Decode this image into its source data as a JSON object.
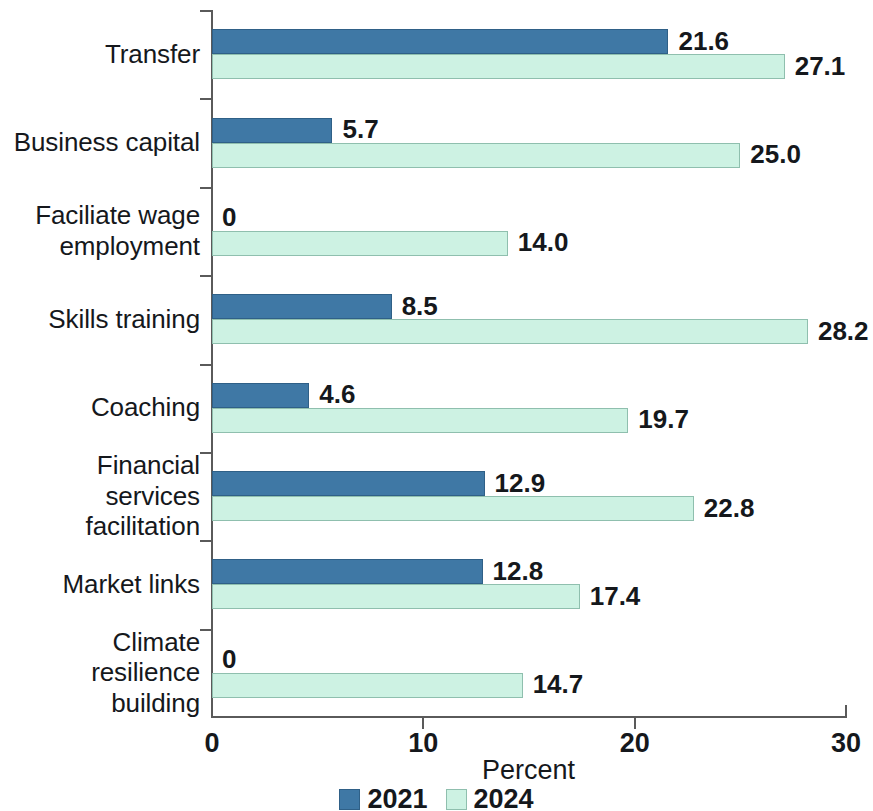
{
  "chart_data": {
    "type": "bar",
    "orientation": "horizontal",
    "title": "",
    "xlabel": "Percent",
    "ylabel": "",
    "xlim": [
      0,
      30
    ],
    "xticks": [
      0,
      10,
      20,
      30
    ],
    "xtick_labels": [
      "0",
      "10",
      "20",
      "30"
    ],
    "grid": false,
    "legend_position": "bottom-center",
    "categories": [
      "Transfer",
      "Business capital",
      "Faciliate wage employment",
      "Skills training",
      "Coaching",
      "Financial services facilitation",
      "Market links",
      "Climate resilience building"
    ],
    "series": [
      {
        "name": "2021",
        "color": "#3f78a5",
        "values": [
          21.6,
          5.7,
          0,
          8.5,
          4.6,
          12.9,
          12.8,
          0
        ],
        "value_labels": [
          "21.6",
          "5.7",
          "0",
          "8.5",
          "4.6",
          "12.9",
          "12.8",
          "0"
        ]
      },
      {
        "name": "2024",
        "color": "#cdf2e3",
        "values": [
          27.1,
          25.0,
          14.0,
          28.2,
          19.7,
          22.8,
          17.4,
          14.7
        ],
        "value_labels": [
          "27.1",
          "25.0",
          "14.0",
          "28.2",
          "19.7",
          "22.8",
          "17.4",
          "14.7"
        ]
      }
    ]
  },
  "legend": {
    "items": [
      {
        "label": "2021",
        "swatch": "s2021"
      },
      {
        "label": "2024",
        "swatch": "s2024"
      }
    ]
  },
  "colors": {
    "series_2021": "#3f78a5",
    "series_2024": "#cdf2e3",
    "axis": "#5a5a5a",
    "text": "#15181c",
    "background": "#ffffff"
  }
}
